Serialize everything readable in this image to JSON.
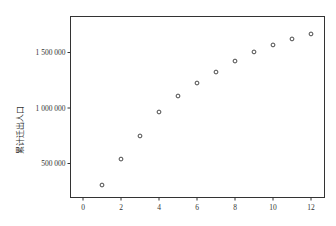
{
  "chart_data": {
    "type": "scatter",
    "title": "",
    "xlabel": "",
    "ylabel": "累计迁出人口",
    "x": [
      1,
      2,
      3,
      4,
      5,
      6,
      7,
      8,
      9,
      10,
      11,
      12
    ],
    "series": [
      {
        "name": "累计迁出人口",
        "values": [
          306000,
          540000,
          748000,
          964000,
          1108000,
          1225000,
          1324000,
          1423000,
          1505000,
          1568000,
          1622000,
          1667000
        ]
      }
    ],
    "xticks": [
      0,
      2,
      4,
      6,
      8,
      10,
      12
    ],
    "yticks": [
      500000,
      1000000,
      1500000
    ],
    "ytick_labels": [
      "500 000",
      "1 000 000",
      "1 500 000"
    ],
    "xlim": [
      -0.7,
      12.7
    ],
    "ylim": [
      0,
      1850000
    ],
    "grid": false,
    "legend": null,
    "marker": "hollow-circle"
  }
}
